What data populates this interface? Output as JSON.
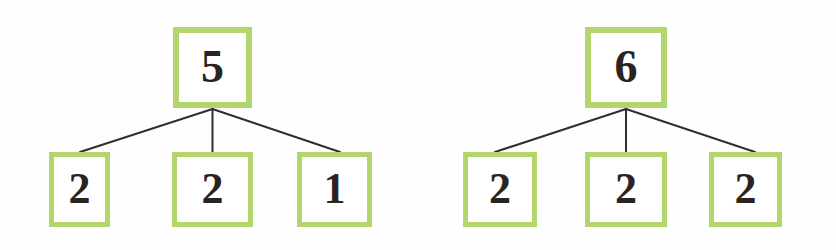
{
  "colors": {
    "box_border": "#b2d66c",
    "numeral": "#2b2320",
    "connector": "#2f2f2f",
    "background": "#ffffff"
  },
  "diagrams": [
    {
      "name": "number-bond-left",
      "whole": {
        "value": "5",
        "x": 173,
        "y": 27,
        "w": 79,
        "h": 81
      },
      "parts": [
        {
          "value": "2",
          "x": 49,
          "y": 152,
          "w": 61,
          "h": 75
        },
        {
          "value": "2",
          "x": 172,
          "y": 152,
          "w": 81,
          "h": 75
        },
        {
          "value": "1",
          "x": 297,
          "y": 152,
          "w": 75,
          "h": 75
        }
      ],
      "connectors": [
        {
          "x1": 212.5,
          "y1": 109,
          "x2": 80,
          "y2": 152
        },
        {
          "x1": 212.5,
          "y1": 109,
          "x2": 212.5,
          "y2": 152
        },
        {
          "x1": 212.5,
          "y1": 109,
          "x2": 340,
          "y2": 152
        }
      ]
    },
    {
      "name": "number-bond-right",
      "whole": {
        "value": "6",
        "x": 585,
        "y": 27,
        "w": 82,
        "h": 81
      },
      "parts": [
        {
          "value": "2",
          "x": 463,
          "y": 152,
          "w": 74,
          "h": 75
        },
        {
          "value": "2",
          "x": 585,
          "y": 152,
          "w": 82,
          "h": 75
        },
        {
          "value": "2",
          "x": 709,
          "y": 152,
          "w": 73,
          "h": 75
        }
      ],
      "connectors": [
        {
          "x1": 626,
          "y1": 109,
          "x2": 495,
          "y2": 152
        },
        {
          "x1": 626,
          "y1": 109,
          "x2": 626,
          "y2": 152
        },
        {
          "x1": 626,
          "y1": 109,
          "x2": 755,
          "y2": 152
        }
      ]
    }
  ]
}
